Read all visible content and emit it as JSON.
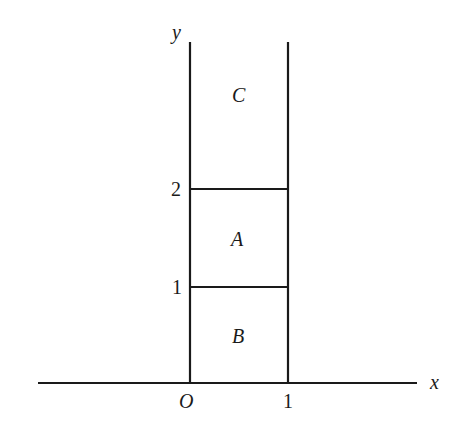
{
  "diagram": {
    "axes": {
      "x_label": "x",
      "y_label": "y",
      "origin_label": "O",
      "x_ticks": [
        {
          "value": 1,
          "label": "1"
        }
      ],
      "y_ticks": [
        {
          "value": 1,
          "label": "1"
        },
        {
          "value": 2,
          "label": "2"
        }
      ]
    },
    "regions": [
      {
        "name": "C",
        "label": "C",
        "bounds": "0<x<1, y>2"
      },
      {
        "name": "A",
        "label": "A",
        "bounds": "0<x<1, 1<y<2"
      },
      {
        "name": "B",
        "label": "B",
        "bounds": "0<x<1, 0<y<1"
      }
    ],
    "colors": {
      "stroke": "#1a1a1a",
      "background": "#ffffff"
    }
  }
}
